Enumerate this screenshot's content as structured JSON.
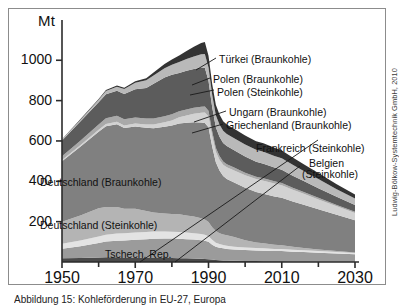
{
  "figure": {
    "y_axis_unit": "Mt",
    "credit": "Ludwig-Bölkow-Systemtechnik GmbH, 2010",
    "caption": "Abbildung 15: Kohleförderung in EU-27, Europa"
  },
  "plot_labels": [
    {
      "name": "deutschland-braunkohle",
      "text": "Deutschland (Braunkohle)"
    },
    {
      "name": "deutschland-steinkohle",
      "text": "Deutschland (Steinkohle)"
    },
    {
      "name": "tschech-rep",
      "text": "Tschech. Rep."
    }
  ],
  "callouts": [
    {
      "name": "tuerkei-braunkohle",
      "text": "Türkei (Braunkohle)"
    },
    {
      "name": "polen-braunkohle",
      "text": "Polen (Braunkohle)"
    },
    {
      "name": "polen-steinkohle",
      "text": "Polen (Steinkohle)"
    },
    {
      "name": "ungarn-braunkohle",
      "text": "Ungarn (Braunkohle)"
    },
    {
      "name": "griechenland-braunkohle",
      "text": "Griechenland (Braunkohle)"
    },
    {
      "name": "frankreich-steinkohle",
      "text": "Frankreich (Steinkohle)"
    },
    {
      "name": "belgien-steinkohle-1",
      "text": "Belgien"
    },
    {
      "name": "belgien-steinkohle-2",
      "text": "(Steinkohle)"
    }
  ],
  "chart_data": {
    "type": "area",
    "title": "",
    "xlabel": "",
    "ylabel": "Mt",
    "xlim": [
      1950,
      2030
    ],
    "ylim": [
      0,
      1150
    ],
    "yticks": [
      200,
      400,
      600,
      800,
      1000
    ],
    "xticks": [
      1950,
      1970,
      1990,
      2010,
      2030
    ],
    "xminorticks": [
      1960,
      1980,
      2000,
      2020
    ],
    "grid": false,
    "legend": "callout-labels",
    "stacked": true,
    "colors": {
      "bottom_dark": "#4a4a4a",
      "tschech_rep": "#9b9b9b",
      "pale_band": "#e3e3e3",
      "deutschland_steinkohle": "#b4b4b4",
      "deutschland_braunkohle": "#808080",
      "griechenland_braunkohle": "#d2d2d2",
      "ungarn_braunkohle": "#a9a9a9",
      "polen_steinkohle": "#5c5c5c",
      "polen_braunkohle": "#b9b9b9",
      "tuerkei_braunkohle": "#333333",
      "frame": "#8c8c8c",
      "axis": "#2b2b2b"
    },
    "x": [
      1950,
      1955,
      1960,
      1962,
      1965,
      1967,
      1970,
      1973,
      1975,
      1978,
      1980,
      1982,
      1984,
      1986,
      1988,
      1989,
      1990,
      1991,
      1992,
      1993,
      1994,
      1995,
      1997,
      2000,
      2003,
      2005,
      2008,
      2010,
      2013,
      2016,
      2020,
      2025,
      2030
    ],
    "series": [
      {
        "name": "Sonstige (unterste Schicht)",
        "key": "bottom_dark",
        "values": [
          18,
          20,
          22,
          23,
          23,
          22,
          22,
          21,
          20,
          20,
          20,
          19,
          18,
          17,
          16,
          15,
          14,
          12,
          10,
          9,
          8,
          7,
          6,
          5,
          5,
          4,
          4,
          4,
          3,
          3,
          2,
          2,
          2
        ]
      },
      {
        "name": "Tschech. Rep.",
        "key": "tschech_rep",
        "values": [
          48,
          58,
          72,
          78,
          82,
          84,
          88,
          92,
          95,
          96,
          96,
          96,
          95,
          94,
          92,
          90,
          86,
          74,
          66,
          62,
          60,
          58,
          56,
          54,
          52,
          52,
          50,
          50,
          48,
          46,
          44,
          40,
          36
        ]
      },
      {
        "name": "Pale Band",
        "key": "pale_band",
        "values": [
          24,
          28,
          32,
          34,
          36,
          36,
          36,
          36,
          36,
          35,
          34,
          34,
          33,
          32,
          31,
          30,
          28,
          24,
          20,
          18,
          16,
          15,
          14,
          13,
          12,
          12,
          11,
          11,
          10,
          9,
          8,
          7,
          6
        ]
      },
      {
        "name": "Deutschland (Steinkohle)",
        "key": "deutschland_steinkohle",
        "values": [
          110,
          125,
          140,
          138,
          132,
          122,
          118,
          104,
          94,
          90,
          88,
          88,
          84,
          82,
          78,
          76,
          70,
          62,
          58,
          54,
          52,
          52,
          48,
          36,
          28,
          25,
          20,
          18,
          14,
          11,
          8,
          5,
          3
        ]
      },
      {
        "name": "Deutschland (Braunkohle)",
        "key": "deutschland_braunkohle",
        "values": [
          300,
          340,
          380,
          400,
          410,
          400,
          408,
          412,
          418,
          430,
          438,
          450,
          460,
          468,
          475,
          478,
          470,
          400,
          340,
          310,
          290,
          280,
          270,
          260,
          250,
          245,
          240,
          235,
          225,
          215,
          200,
          180,
          160
        ]
      },
      {
        "name": "Griechenland (Braunkohle)",
        "key": "griechenland_braunkohle",
        "values": [
          6,
          8,
          10,
          11,
          12,
          13,
          14,
          16,
          18,
          22,
          26,
          30,
          36,
          42,
          48,
          52,
          54,
          52,
          52,
          54,
          56,
          58,
          60,
          62,
          64,
          65,
          64,
          62,
          58,
          54,
          48,
          42,
          36
        ]
      },
      {
        "name": "Ungarn (Braunkohle)",
        "key": "ungarn_braunkohle",
        "values": [
          18,
          22,
          26,
          28,
          30,
          30,
          30,
          30,
          30,
          30,
          30,
          30,
          30,
          30,
          30,
          30,
          28,
          24,
          20,
          18,
          16,
          15,
          14,
          13,
          12,
          12,
          11,
          11,
          10,
          9,
          8,
          7,
          6
        ]
      },
      {
        "name": "Polen (Steinkohle)",
        "key": "polen_steinkohle",
        "values": [
          78,
          95,
          110,
          120,
          124,
          126,
          140,
          152,
          172,
          192,
          196,
          190,
          192,
          192,
          194,
          192,
          148,
          120,
          102,
          96,
          92,
          90,
          86,
          80,
          74,
          72,
          68,
          66,
          60,
          54,
          48,
          40,
          34
        ]
      },
      {
        "name": "Polen (Braunkohle)",
        "key": "polen_braunkohle",
        "values": [
          5,
          8,
          12,
          16,
          20,
          24,
          32,
          38,
          42,
          46,
          50,
          54,
          58,
          62,
          66,
          68,
          66,
          62,
          60,
          60,
          60,
          60,
          60,
          60,
          60,
          60,
          58,
          57,
          54,
          50,
          45,
          38,
          32
        ]
      },
      {
        "name": "Türkei (Braunkohle)",
        "key": "tuerkei_braunkohle",
        "values": [
          2,
          3,
          4,
          5,
          6,
          7,
          8,
          10,
          14,
          20,
          26,
          32,
          40,
          48,
          56,
          60,
          58,
          54,
          52,
          50,
          48,
          47,
          46,
          44,
          42,
          42,
          40,
          39,
          36,
          33,
          30,
          25,
          20
        ]
      }
    ]
  }
}
